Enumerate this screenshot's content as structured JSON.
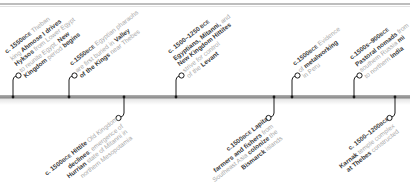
{
  "colors": {
    "bar": "#9a9a9a",
    "connector": "#1a1a1a",
    "emphasis_text": "#3a3a3a",
    "secondary_text": "#a9a9a9"
  },
  "events_above": [
    {
      "id": "e1",
      "x": 13,
      "lines": [
        [
          {
            "t": "c. 1550",
            "b": true
          },
          {
            "t": "BCE",
            "b": true,
            "bce": true
          },
          {
            "t": " Theban"
          }
        ],
        [
          {
            "t": "king "
          },
          {
            "t": "Ahmose I drives",
            "b": true
          }
        ],
        [
          {
            "t": "Hyksos",
            "b": true
          },
          {
            "t": " from Lower Egypt"
          }
        ],
        [
          {
            "t": "to reunite Egypt. "
          },
          {
            "t": "New",
            "b": true
          }
        ],
        [
          {
            "t": "Kingdom",
            "b": true
          },
          {
            "t": " period "
          },
          {
            "t": "begins",
            "b": true
          }
        ]
      ]
    },
    {
      "id": "e2",
      "x": 69,
      "lines": [
        [
          {
            "t": "c.1550",
            "b": true
          },
          {
            "t": "BCE",
            "b": true,
            "bce": true
          },
          {
            "t": " Egyptian pharaohs"
          }
        ],
        [
          {
            "t": "are first buried in "
          },
          {
            "t": "Valley",
            "b": true
          }
        ],
        [
          {
            "t": "of the Kings",
            "b": true
          },
          {
            "t": " near Thebes"
          }
        ]
      ]
    },
    {
      "id": "e3",
      "x": 176,
      "lines": [
        [
          {
            "t": "c. 1500–1250",
            "b": true
          },
          {
            "t": " BCE",
            "b": true,
            "bce": true
          }
        ],
        [
          {
            "t": "Egyptians, Mitanni,",
            "b": true
          },
          {
            "t": " and"
          }
        ],
        [
          {
            "t": "New Kingdom Hittites",
            "b": true
          }
        ],
        [
          {
            "t": "strive for control"
          }
        ],
        [
          {
            "t": "of the "
          },
          {
            "t": "Levant",
            "b": true
          }
        ]
      ]
    },
    {
      "id": "e4",
      "x": 292,
      "lines": [
        [
          {
            "t": "c.1500",
            "b": true
          },
          {
            "t": "BCE",
            "b": true,
            "bce": true
          },
          {
            "t": " Evidence"
          }
        ],
        [
          {
            "t": "of "
          },
          {
            "t": "metalworking",
            "b": true
          }
        ],
        [
          {
            "t": "in Peru"
          }
        ]
      ]
    },
    {
      "id": "e5",
      "x": 354,
      "lines": [
        [
          {
            "t": "c.1500s–900",
            "b": true
          },
          {
            "t": "BCE",
            "b": true,
            "bce": true
          }
        ],
        [
          {
            "t": "Pastoral nomads",
            "b": true
          },
          {
            "t": " from"
          }
        ],
        [
          {
            "t": "southern Russia "
          },
          {
            "t": "mi",
            "b": true
          }
        ],
        [
          {
            "t": "to northern "
          },
          {
            "t": "India",
            "b": true
          }
        ]
      ]
    }
  ],
  "events_below": [
    {
      "id": "b1",
      "x": 124,
      "lines": [
        [
          {
            "t": "c. 1500",
            "b": true
          },
          {
            "t": "BCE",
            "b": true,
            "bce": true
          },
          {
            "t": " Hittite",
            "b": true
          },
          {
            "t": " Old Kingdom"
          }
        ],
        [
          {
            "t": "declines",
            "b": true
          },
          {
            "t": "; emergence of"
          }
        ],
        [
          {
            "t": "Hurrian",
            "b": true
          },
          {
            "t": " state of Mitanni in"
          }
        ],
        [
          {
            "t": "northern Mesopotamia"
          }
        ]
      ]
    },
    {
      "id": "b2",
      "x": 274,
      "lines": [
        [
          {
            "t": "c.1500",
            "b": true
          },
          {
            "t": "BCE",
            "b": true,
            "bce": true
          },
          {
            "t": " Lapita",
            "b": true
          }
        ],
        [
          {
            "t": "farmers and fishers",
            "b": true
          },
          {
            "t": " from"
          }
        ],
        [
          {
            "t": "Southeast Asia "
          },
          {
            "t": "colonize",
            "b": true
          },
          {
            "t": " the"
          }
        ],
        [
          {
            "t": "Bismarck",
            "b": true
          },
          {
            "t": " islands"
          }
        ]
      ]
    },
    {
      "id": "b3",
      "x": 395,
      "lines": [
        [
          {
            "t": "c. 1500–1200",
            "b": true
          },
          {
            "t": "BCE",
            "b": true,
            "bce": true
          }
        ],
        [
          {
            "t": "Karnak",
            "b": true
          },
          {
            "t": " temple complex"
          }
        ],
        [
          {
            "t": "at Thebes",
            "b": true
          },
          {
            "t": " constructed"
          }
        ]
      ]
    }
  ]
}
